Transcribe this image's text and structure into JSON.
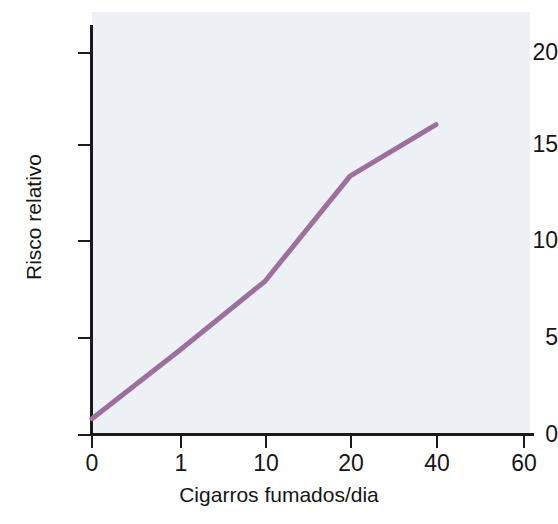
{
  "chart_data": {
    "type": "line",
    "title": "",
    "xlabel": "Cigarros fumados/dia",
    "ylabel": "Risco relativo",
    "x_tick_labels": [
      "0",
      "1",
      "10",
      "20",
      "40",
      "60"
    ],
    "x_tick_values": [
      0,
      1,
      10,
      20,
      40,
      60
    ],
    "x_scale": "categorical-ordinal",
    "y_tick_labels": [
      "0",
      "5",
      "10",
      "15",
      "20"
    ],
    "y_tick_values": [
      0,
      5,
      10,
      15,
      20
    ],
    "ylim": [
      0,
      21.5
    ],
    "grid": false,
    "legend": "none",
    "series": [
      {
        "name": "Risco relativo",
        "color": "#9d6f9d",
        "line_width": 5,
        "x": [
          0,
          1,
          10,
          20,
          40
        ],
        "values": [
          0.8,
          4.4,
          8.0,
          13.5,
          16.2
        ]
      }
    ]
  },
  "figure": {
    "plot_background_color": "#edf1f5",
    "axis_color": "#1a1a1a",
    "page_background_color": "#ffffff"
  }
}
